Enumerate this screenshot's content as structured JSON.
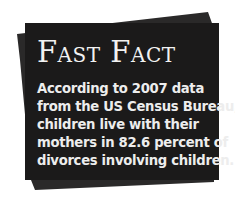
{
  "callout": {
    "title": "Fast Fact",
    "body_lines": [
      "According to 2007 data",
      "from the US Census Bureau,",
      "children live with their",
      "mothers in 82.6 percent of",
      "divorces involving children."
    ],
    "colors": {
      "card_front": "#1b1a1a",
      "card_back": "#2a2929",
      "text": "#f2f2f2",
      "background": "#ffffff"
    }
  }
}
